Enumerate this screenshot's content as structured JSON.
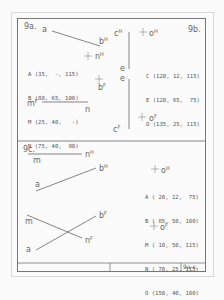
{
  "sheet": {
    "id_label": "9a-c",
    "colors": {
      "line": "#777777",
      "text": "#666666",
      "frame_faint": "#d8d8d8"
    }
  },
  "panel_9a": {
    "title": "9a.",
    "labels": {
      "a": "a",
      "bH": "b",
      "bH_sup": "H",
      "nH": "n",
      "nH_sup": "H",
      "bF": "b",
      "bF_sup": "F",
      "mF": "m",
      "mF_sup": "F",
      "n": "n"
    },
    "coords": [
      "A (35,  -, 115)",
      "B (88, 65, 100)",
      "M (25, 40,   -)",
      "N (75, 40,  90)"
    ]
  },
  "panel_9b": {
    "title": "9b.",
    "labels": {
      "cH": "c",
      "cH_sup": "H",
      "e1": "e",
      "e2": "e",
      "cF": "c",
      "cF_sup": "F",
      "oH": "o",
      "oH_sup": "H",
      "oF": "o",
      "oF_sup": "F"
    },
    "coords": [
      "C (120, 12, 115)",
      "E (120, 65,  75)",
      "O (135, 25, 115)"
    ]
  },
  "panel_9c": {
    "title": "9c.",
    "labels": {
      "m_top": "m",
      "nH": "n",
      "nH_sup": "H",
      "bH": "b",
      "bH_sup": "H",
      "a_top": "a",
      "m_bot": "m",
      "bF": "b",
      "bF_sup": "F",
      "nF": "n",
      "nF_sup": "F",
      "a_bot": "a",
      "oH": "o",
      "oH_sup": "H",
      "oF": "o",
      "oF_sup": "F"
    },
    "coords": [
      "A ( 20, 12,  75)",
      "B ( 85, 50, 100)",
      "M ( 10, 50, 115)",
      "N ( 70, 25, 115)",
      "O (150, 40, 100)"
    ]
  }
}
